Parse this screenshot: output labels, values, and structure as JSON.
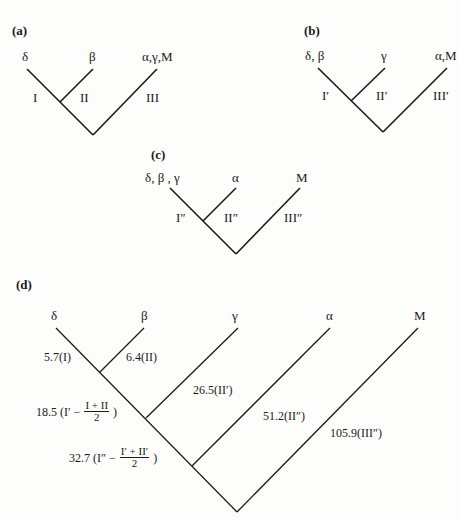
{
  "caption_fragment": "...ape phylogenies (d)",
  "panels": {
    "a": {
      "label": "(a)",
      "leaves": [
        "δ",
        "β",
        "α,γ,M"
      ],
      "branches": [
        "I",
        "II",
        "III"
      ]
    },
    "b": {
      "label": "(b)",
      "leaves": [
        "δ, β",
        "γ",
        "α,M"
      ],
      "branches": [
        "I′",
        "II′",
        "III′"
      ]
    },
    "c": {
      "label": "(c)",
      "leaves": [
        "δ, β , γ",
        "α",
        "M"
      ],
      "branches": [
        "I″",
        "II″",
        "III″"
      ]
    },
    "d": {
      "label": "(d)",
      "leaves": [
        "δ",
        "β",
        "γ",
        "α",
        "M"
      ],
      "branches": {
        "delta": "5.7(I)",
        "beta": "6.4(II)",
        "gamma": "26.5(II′)",
        "alpha": "51.2(II″)",
        "M": "105.9(III″)",
        "internal1_value": "18.5",
        "internal1_prefix": "(I′ −",
        "internal1_num": "I + II",
        "internal1_den": "2",
        "internal1_suffix": ")",
        "internal2_value": "32.7",
        "internal2_prefix": "(I″ −",
        "internal2_num": "I′ + II′",
        "internal2_den": "2",
        "internal2_suffix": ")"
      }
    }
  },
  "line_color": "#1a1a1a"
}
